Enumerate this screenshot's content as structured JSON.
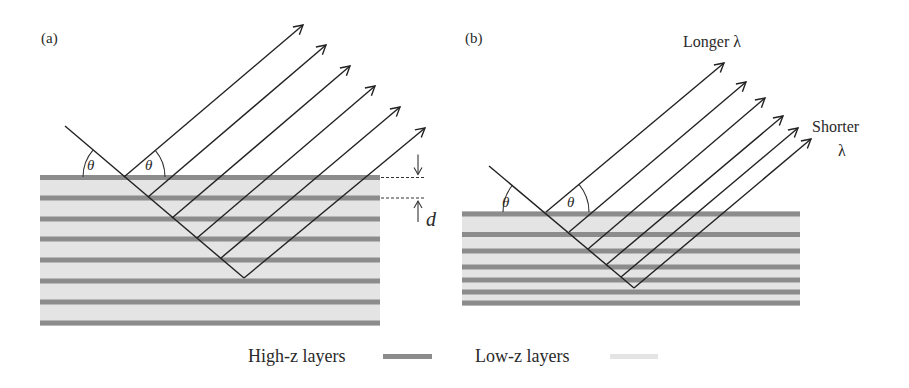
{
  "colors": {
    "high_z": "#8c8c8c",
    "low_z": "#e4e4e4",
    "ray": "#222222",
    "text": "#2a2a2a"
  },
  "panel_a": {
    "label": "(a)",
    "theta_symbol": "θ",
    "spacing_label": "d",
    "stack": {
      "x0": 40,
      "x1": 380,
      "y_top": 175,
      "y_bottom": 326
    },
    "high_z_layers_y": [
      177.5,
      198,
      219,
      239,
      260,
      281,
      302,
      323
    ],
    "incident_start": [
      65,
      126
    ],
    "reflection_points": [
      [
        124,
        177
      ],
      [
        148,
        197
      ],
      [
        172,
        218
      ],
      [
        197,
        238
      ],
      [
        221,
        258
      ]
    ],
    "vertex": [
      244,
      278
    ],
    "arrow_tips": [
      [
        303,
        25
      ],
      [
        326,
        45
      ],
      [
        350,
        66
      ],
      [
        375,
        86
      ],
      [
        400,
        107
      ],
      [
        425,
        128
      ]
    ],
    "theta_arc_radius": 41,
    "spacing_marker": {
      "x_dash_start": 381,
      "x_dash_end": 425,
      "y_top": 177.5,
      "y_bottom": 198,
      "arrow_x": 418
    }
  },
  "panel_b": {
    "label": "(b)",
    "theta_symbol": "θ",
    "longer_label": "Longer λ",
    "shorter_label": "Shorter",
    "shorter_lambda": "λ",
    "stack": {
      "x0": 462,
      "x1": 800,
      "y_top": 211,
      "y_bottom": 306
    },
    "high_z_layers_y": [
      214,
      234.5,
      251,
      267,
      280,
      292,
      303
    ],
    "incident_start": [
      489,
      166
    ],
    "reflection_points": [
      [
        546,
        212
      ],
      [
        569,
        232
      ],
      [
        588,
        249
      ],
      [
        606,
        265
      ],
      [
        621,
        277
      ]
    ],
    "vertex": [
      634,
      288
    ],
    "arrow_tips": [
      [
        724,
        63
      ],
      [
        746,
        82
      ],
      [
        765,
        98
      ],
      [
        783,
        116
      ],
      [
        798,
        128
      ],
      [
        811,
        139
      ]
    ],
    "theta_arc_radius": 43
  },
  "legend": {
    "high_z_label": "High-z layers",
    "low_z_label": "Low-z layers"
  }
}
